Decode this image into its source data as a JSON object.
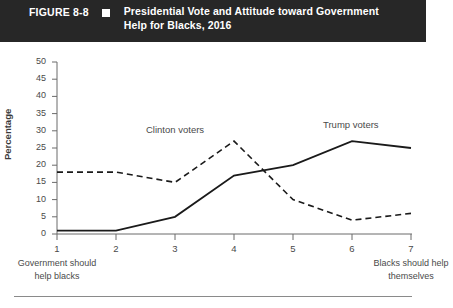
{
  "header": {
    "figure_number": "FIGURE 8-8",
    "marker": "black-square",
    "title": "Presidential Vote and Attitude toward Government Help for Blacks, 2016"
  },
  "axes": {
    "y_label": "Percentage",
    "y_ticks": [
      "0",
      "5",
      "10",
      "15",
      "20",
      "25",
      "30",
      "35",
      "40",
      "45",
      "50"
    ],
    "x_ticks": [
      "1",
      "2",
      "3",
      "4",
      "5",
      "6",
      "7"
    ],
    "anchor_left": "Government should help blacks",
    "anchor_right": "Blacks should help themselves"
  },
  "series_labels": {
    "clinton": "Clinton voters",
    "trump": "Trump voters"
  },
  "colors": {
    "header_background": "#272727",
    "header_text": "#ffffff",
    "line": "#1a1a1a",
    "axis": "#6b6b6b",
    "tick_text": "#4a4a4a"
  },
  "chart_data": {
    "type": "line",
    "title": "Presidential Vote and Attitude toward Government Help for Blacks, 2016",
    "xlabel": "",
    "ylabel": "Percentage",
    "x": [
      1,
      2,
      3,
      4,
      5,
      6,
      7
    ],
    "categories": [
      "1",
      "2",
      "3",
      "4",
      "5",
      "6",
      "7"
    ],
    "xlim": [
      1,
      7
    ],
    "ylim": [
      0,
      50
    ],
    "y_tick_step": 5,
    "grid": false,
    "legend_position": "inline-annotation",
    "x_axis_anchors": {
      "low": "Government should help blacks",
      "high": "Blacks should help themselves"
    },
    "series": [
      {
        "name": "Clinton voters",
        "style": "dashed",
        "values": [
          18,
          18,
          15,
          27,
          10,
          4,
          6
        ]
      },
      {
        "name": "Trump voters",
        "style": "solid",
        "values": [
          1,
          1,
          5,
          17,
          20,
          27,
          25
        ]
      }
    ]
  }
}
